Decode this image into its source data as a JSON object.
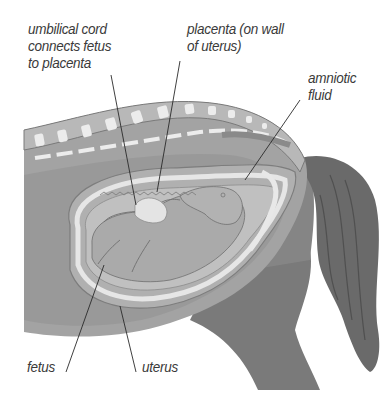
{
  "diagram": {
    "labels": {
      "umbilical_cord": "umbilical cord\nconnects fetus\nto placenta",
      "placenta": "placenta (on wall\nof uterus)",
      "amniotic_fluid": "amniotic\nfluid",
      "fetus": "fetus",
      "uterus": "uterus"
    },
    "colors": {
      "background": "#ffffff",
      "body_dark": "#6e6e6e",
      "body_mid": "#9a9a9a",
      "body_light": "#b4b4b4",
      "uterus_wall": "#a8a8a8",
      "amniotic_fluid": "#c2c2c2",
      "fetus": "#a9a9a9",
      "highlight": "#e8e8e8",
      "leader_line": "#2a2a2a",
      "label_text": "#3a3a3a"
    }
  }
}
